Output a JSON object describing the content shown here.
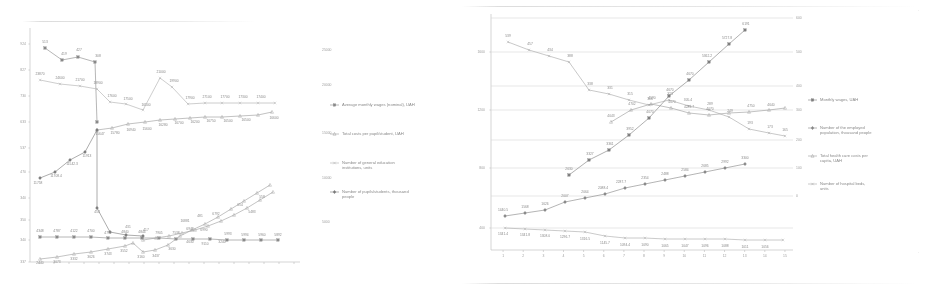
{
  "document": {
    "type": "scanned-figure-page",
    "panel_count": 2
  },
  "decor": {
    "top_rule_left": "",
    "top_rule_right": "",
    "bottom_rule_right": "",
    "corner_mark_top_right": "·",
    "corner_mark_right": "·"
  },
  "chart_data": [
    {
      "id": "left-chart",
      "type": "line",
      "title": "",
      "subtitle": "",
      "xlabel": "",
      "ylabel": "",
      "grid": true,
      "legend_position": "right",
      "x": [
        1,
        2,
        3,
        4,
        5,
        6,
        7,
        8,
        9,
        10,
        11,
        12,
        13,
        14,
        15,
        16,
        17,
        18
      ],
      "xtick_labels": [
        "",
        "",
        "",
        "",
        "",
        "",
        "",
        "",
        "",
        "",
        "",
        "",
        "",
        "",
        "",
        "",
        "",
        ""
      ],
      "ytick_labels": [
        "924",
        "827",
        "730",
        "633",
        "537",
        "470",
        "340",
        "350",
        "340",
        "337"
      ],
      "ylim": [
        0,
        924
      ],
      "y2tick_labels": [
        "25000",
        "20000",
        "15000",
        "10000",
        "5000",
        "0"
      ],
      "y2lim": [
        0,
        25000
      ],
      "series": [
        {
          "name": "Average monthly wages (nominal), UAH",
          "marker": "square-filled",
          "color": "#6f6f6f",
          "values": [
            513,
            419,
            427,
            308,
            484,
            406,
            419,
            444,
            419,
            449,
            519,
            568,
            649,
            731,
            841,
            954,
            1043,
            1082
          ],
          "labels": [
            "513",
            "419",
            "427",
            "308",
            "484",
            "406",
            "419",
            "444",
            "419",
            "449",
            "519",
            "568",
            "649",
            "731",
            "841",
            "954",
            "1043",
            "1082"
          ]
        },
        {
          "name": "Total costs per pupil/student, UAH",
          "marker": "triangle",
          "color": "#8a8a8a",
          "values": [
            null,
            null,
            null,
            null,
            null,
            15647,
            15780,
            16940,
            15600,
            16280,
            16700,
            16200,
            16750,
            16500,
            16600,
            null,
            null,
            null
          ],
          "labels": [
            "",
            "",
            "",
            "",
            "",
            "15647",
            "15780",
            "16940",
            "15600",
            "16280",
            "16700",
            "16200",
            "16750",
            "16500",
            "16600",
            "",
            "",
            ""
          ]
        },
        {
          "name": "Number of general education institutions, units",
          "marker": "cross",
          "color": "#a8a8a8",
          "values": [
            23870,
            24600,
            21700,
            18900,
            17600,
            17500,
            16500,
            21000,
            19900,
            17900,
            27100,
            17700,
            17300,
            17400,
            null,
            null,
            null,
            null
          ],
          "labels": [
            "23870",
            "24600",
            "21700",
            "18900",
            "17600",
            "17500",
            "16500",
            "21000",
            "19900",
            "17900",
            "27100",
            "17700",
            "17300",
            "17400",
            "",
            "",
            "",
            ""
          ]
        },
        {
          "name": "Number of pupils/students, thousand people",
          "marker": "diamond-filled",
          "color": "#565656",
          "values": [
            11758,
            11708.4,
            11542.3,
            11913,
            null,
            454,
            431,
            408,
            436,
            466,
            521,
            563,
            588,
            610,
            655,
            700,
            760,
            800
          ],
          "labels": [
            "11758",
            "11708.4",
            "11542.3",
            "11913",
            "",
            "454",
            "431",
            "408",
            "436",
            "466",
            "521",
            "563",
            "588",
            "610",
            "655",
            "700",
            "760",
            "800"
          ]
        },
        {
          "name": "series-flat-lower",
          "marker": "square-filled",
          "color": "#707070",
          "values": [
            4348,
            4787,
            4122,
            4700,
            4791,
            4740,
            4840,
            4844,
            7905,
            7538,
            6949,
            6990,
            5993,
            5994,
            5960,
            5892,
            null,
            null
          ],
          "labels": [
            "4348",
            "4787",
            "4122",
            "4700",
            "4791",
            "4740",
            "4840",
            "4844",
            "7905",
            "7538",
            "6949",
            "6990",
            "5993",
            "5994",
            "5960",
            "5892",
            "",
            ""
          ]
        },
        {
          "name": "series-rising-lowest",
          "marker": "triangle",
          "color": "#8f8f8f",
          "values": [
            2440,
            3073,
            3332,
            3626,
            3743,
            3552,
            3160,
            3437,
            3630,
            4630,
            9110,
            3240,
            null,
            null,
            null,
            null,
            null,
            null
          ],
          "labels": [
            "2440",
            "3073",
            "3332",
            "3626",
            "3743",
            "3552",
            "3160",
            "3437",
            "3630",
            "4630",
            "9110",
            "3240",
            "",
            "",
            "",
            "",
            "",
            ""
          ]
        }
      ],
      "legend": [
        {
          "label": "Average monthly wages (nominal), UAH",
          "marker": "square-filled",
          "color": "#6f6f6f"
        },
        {
          "label": "Total costs per pupil/student, UAH",
          "marker": "triangle",
          "color": "#8a8a8a"
        },
        {
          "label": "Number of general education institutions, units",
          "marker": "cross",
          "color": "#a8a8a8"
        },
        {
          "label": "Number of pupils/students, thousand people",
          "marker": "diamond-filled",
          "color": "#565656"
        }
      ]
    },
    {
      "id": "right-chart",
      "type": "line",
      "title": "",
      "subtitle": "",
      "xlabel": "",
      "ylabel": "",
      "grid": true,
      "legend_position": "right",
      "x": [
        1,
        2,
        3,
        4,
        5,
        6,
        7,
        8,
        9,
        10,
        11,
        12,
        13,
        14,
        15
      ],
      "xtick_labels": [
        "1",
        "2",
        "3",
        "4",
        "5",
        "6",
        "7",
        "8",
        "9",
        "10",
        "11",
        "12",
        "13",
        "14",
        "15"
      ],
      "ytick_labels": [
        "1600",
        "1200",
        "800",
        "400",
        "0"
      ],
      "ylim": [
        0,
        1600
      ],
      "y2tick_labels": [
        "600",
        "500",
        "400",
        "300",
        "200",
        "100",
        "0"
      ],
      "y2lim": [
        0,
        600
      ],
      "series": [
        {
          "name": "Number of hospital beds, units",
          "marker": "cross",
          "color": "#9a9a9a",
          "values": [
            539,
            457,
            434,
            388,
            338,
            331,
            315,
            306,
            323,
            305.4,
            289,
            249,
            193,
            173,
            165
          ],
          "labels": [
            "539",
            "457",
            "434",
            "388",
            "338",
            "331",
            "315",
            "306",
            "323",
            "305.4",
            "289",
            "249",
            "193",
            "173",
            "165"
          ]
        },
        {
          "name": "Total health care costs per capita, UAH",
          "marker": "triangle",
          "color": "#8a8a8a",
          "values": [
            null,
            null,
            null,
            null,
            null,
            null,
            4043,
            4702,
            4590,
            4070,
            4283.7,
            4070,
            4750,
            4640,
            null
          ],
          "labels": [
            "",
            "",
            "",
            "",
            "",
            "",
            "4043",
            "4702",
            "4590",
            "4070",
            "4283.7",
            "4070",
            "4750",
            "4640",
            ""
          ]
        },
        {
          "name": "Monthly wages, UAH",
          "marker": "square-filled",
          "color": "#5f5f5f",
          "values": [
            null,
            null,
            null,
            null,
            2630,
            3327,
            3361,
            3952,
            4070,
            4670,
            4670,
            5362.2,
            5727.8,
            6191,
            null
          ],
          "labels": [
            "",
            "",
            "",
            "",
            "2630",
            "3327",
            "3361",
            "3952",
            "4070",
            "4670",
            "4670",
            "5362.2",
            "5727.8",
            "6191",
            ""
          ]
        },
        {
          "name": "Number of the employed population, thousand people",
          "marker": "diamond-filled",
          "color": "#6a6a6a",
          "values": [
            1440.5,
            1568,
            1626,
            2007,
            2064,
            2088.4,
            2287.7,
            2354,
            2488,
            2584,
            2685,
            2992,
            3300,
            null,
            null
          ],
          "labels": [
            "1440.5",
            "1568",
            "1626",
            "2007",
            "2064",
            "2088.4",
            "2287.7",
            "2354",
            "2488",
            "2584",
            "2685",
            "2992",
            "3300",
            "",
            ""
          ]
        },
        {
          "name": "series-flat-bottom",
          "marker": "cross",
          "color": "#a0a0a0",
          "values": [
            1341.4,
            1341.8,
            1308.0,
            1296.7,
            1316.5,
            1145.7,
            1094.4,
            1090,
            1065,
            1047,
            1096,
            1088,
            1011,
            1056,
            null
          ],
          "labels": [
            "1341.4",
            "1341.8",
            "1308.0",
            "1296.7",
            "1316.5",
            "1145.7",
            "1094.4",
            "1090",
            "1065",
            "1047",
            "1096",
            "1088",
            "1011",
            "1056",
            ""
          ]
        }
      ],
      "legend": [
        {
          "label": "Monthly wages, UAH",
          "marker": "square-filled",
          "color": "#5f5f5f"
        },
        {
          "label": "Number of the employed population, thousand people",
          "marker": "diamond-filled",
          "color": "#6a6a6a"
        },
        {
          "label": "Total health care costs per capita, UAH",
          "marker": "triangle",
          "color": "#8a8a8a"
        },
        {
          "label": "Number of hospital beds, units",
          "marker": "cross",
          "color": "#9a9a9a"
        }
      ]
    }
  ]
}
